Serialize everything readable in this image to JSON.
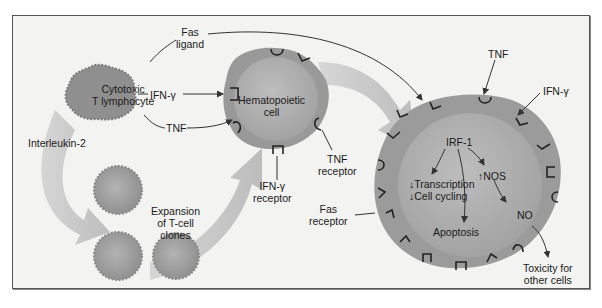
{
  "diagram": {
    "cells": {
      "cytotoxic": {
        "line1": "Cytotoxic",
        "line2": "T lymphocyte"
      },
      "hematopoietic": {
        "line1": "Hematopoietic",
        "line2": "cell"
      },
      "expansion": {
        "line1": "Expansion",
        "line2": "of T-cell",
        "line3": "clones"
      }
    },
    "signals": {
      "fas_ligand": {
        "line1": "Fas",
        "line2": "ligand"
      },
      "ifn_gamma_left": "IFN-γ",
      "tnf_left": "TNF",
      "interleukin": "Interleukin-2",
      "tnf_top": "TNF",
      "ifn_gamma_right": "IFN-γ"
    },
    "receptors": {
      "tnf_receptor": {
        "line1": "TNF",
        "line2": "receptor"
      },
      "ifn_receptor": {
        "line1": "IFN-γ",
        "line2": "receptor"
      },
      "fas_receptor": {
        "line1": "Fas",
        "line2": "receptor"
      }
    },
    "target_cell": {
      "irf": "IRF-1",
      "transcription": "Transcription",
      "cell_cycling": "Cell cycling",
      "down_arrow": "↓",
      "up_arrow": "↑",
      "nos": "NOS",
      "no": "NO",
      "apoptosis": "Apoptosis"
    },
    "outcome": {
      "line1": "Toxicity for",
      "line2": "other cells"
    },
    "colors": {
      "background": "#f3f3f1",
      "cell_outer": "#9a9a9a",
      "cell_inner": "#b5b5b5",
      "big_arrow": "#c9c9c9",
      "line": "#333333"
    }
  }
}
